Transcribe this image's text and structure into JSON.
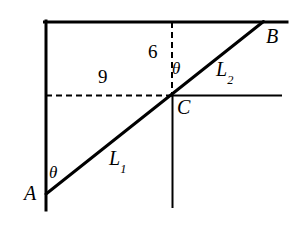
{
  "figure": {
    "kind": "geometry-diagram",
    "background_color": "#ffffff",
    "stroke_color": "#000000",
    "points": {
      "A": {
        "label": "A",
        "x": 46,
        "y": 194
      },
      "B": {
        "label": "B",
        "x": 263,
        "y": 22
      },
      "C": {
        "label": "C",
        "x": 172,
        "y": 96
      }
    },
    "segments": {
      "L1": {
        "label": "L",
        "sub": "1",
        "from": "A",
        "to": "C"
      },
      "L2": {
        "label": "L",
        "sub": "2",
        "from": "C",
        "to": "B"
      }
    },
    "measures": {
      "horizontal": {
        "value": "9"
      },
      "vertical": {
        "value": "6"
      }
    },
    "angles": {
      "at_A": {
        "symbol": "θ"
      },
      "at_C": {
        "symbol": "θ"
      }
    },
    "lines": {
      "left_vertical": {
        "x": 46,
        "y1": 22,
        "y2": 210,
        "style": "solid",
        "width": 3
      },
      "top_horizontal": {
        "y": 22,
        "x1": 45,
        "x2": 287,
        "style": "solid",
        "width": 3
      },
      "dashed_horizontal": {
        "y": 96,
        "x1": 46,
        "x2": 172,
        "style": "dashed",
        "width": 2
      },
      "dashed_vertical": {
        "x": 172,
        "y1": 22,
        "y2": 96,
        "style": "dashed",
        "width": 2
      },
      "right_horizontal": {
        "y": 96,
        "x1": 172,
        "x2": 281,
        "style": "solid",
        "width": 2
      },
      "lower_vertical": {
        "x": 172,
        "y1": 96,
        "y2": 207,
        "style": "solid",
        "width": 2
      },
      "diagonal": {
        "x1": 46,
        "y1": 194,
        "x2": 263,
        "y2": 22,
        "style": "solid",
        "width": 3
      }
    }
  }
}
